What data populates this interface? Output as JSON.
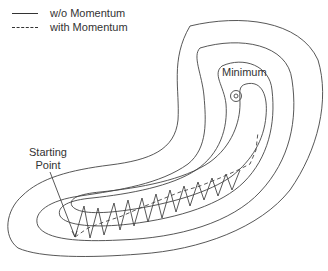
{
  "legend": {
    "items": [
      {
        "style": "solid",
        "label": "w/o Momentum"
      },
      {
        "style": "dashed",
        "label": "with Momentum"
      }
    ]
  },
  "labels": {
    "minimum": "Minimum",
    "starting_point_line1": "Starting",
    "starting_point_line2": "Point"
  },
  "colors": {
    "line": "#333333",
    "background": "#ffffff"
  }
}
